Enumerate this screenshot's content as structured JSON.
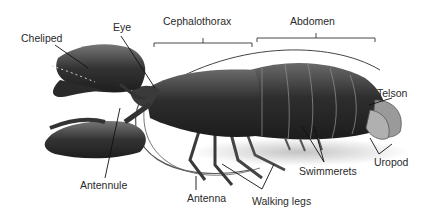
{
  "diagram": {
    "labels": {
      "cheliped": "Cheliped",
      "eye": "Eye",
      "cephalothorax": "Cephalothorax",
      "abdomen": "Abdomen",
      "telson": "Telson",
      "antennule": "Antennule",
      "antenna": "Antenna",
      "walking_legs": "Walking legs",
      "swimmerets": "Swimmerets",
      "uropod": "Uropod"
    }
  }
}
